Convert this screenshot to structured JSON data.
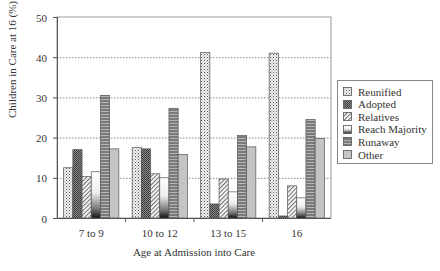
{
  "chart_data": {
    "type": "bar",
    "title": "",
    "xlabel": "Age at Admission into Care",
    "ylabel": "Children in Care at 16 (%)",
    "ylim": [
      0,
      50
    ],
    "yticks": [
      0,
      10,
      20,
      30,
      40,
      50
    ],
    "grid": "horizontal dotted",
    "legend_position": "right",
    "categories": [
      "7 to 9",
      "10 to 12",
      "13 to 15",
      "16"
    ],
    "series": [
      {
        "name": "Reunified",
        "pattern": "dots",
        "values": [
          12.5,
          17.5,
          41.2,
          41.0
        ]
      },
      {
        "name": "Adopted",
        "pattern": "dense-crosshatch",
        "values": [
          17.0,
          17.2,
          3.5,
          0.5
        ]
      },
      {
        "name": "Relatives",
        "pattern": "diagonal-stripes",
        "values": [
          10.3,
          11.0,
          9.7,
          8.0
        ]
      },
      {
        "name": "Reach Majority",
        "pattern": "white-to-black-gradient",
        "values": [
          11.5,
          10.0,
          6.5,
          5.0
        ]
      },
      {
        "name": "Runaway",
        "pattern": "horizontal-stripes",
        "values": [
          30.5,
          27.3,
          20.5,
          24.5
        ]
      },
      {
        "name": "Other",
        "pattern": "light-gray",
        "values": [
          17.2,
          15.8,
          17.7,
          19.8
        ]
      }
    ]
  }
}
